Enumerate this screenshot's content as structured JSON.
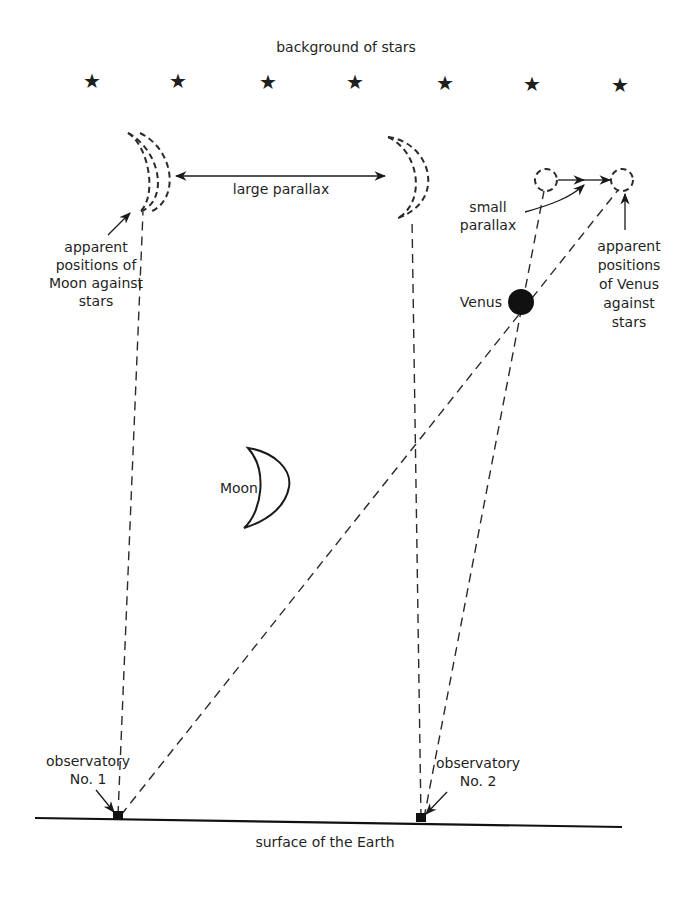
{
  "diagram": {
    "title": "background of stars",
    "star_glyph": "★",
    "stars": [
      {
        "x": 92,
        "y": 82
      },
      {
        "x": 178,
        "y": 82
      },
      {
        "x": 268,
        "y": 83
      },
      {
        "x": 355,
        "y": 83
      },
      {
        "x": 445,
        "y": 84
      },
      {
        "x": 532,
        "y": 85
      },
      {
        "x": 620,
        "y": 86
      }
    ],
    "labels": {
      "large_parallax": "large parallax",
      "small_parallax_line1": "small",
      "small_parallax_line2": "parallax",
      "moon_apparent_line1": "apparent",
      "moon_apparent_line2": "positions of",
      "moon_apparent_line3": "Moon against",
      "moon_apparent_line4": "stars",
      "venus_apparent_line1": "apparent",
      "venus_apparent_line2": "positions",
      "venus_apparent_line3": "of Venus",
      "venus_apparent_line4": "against",
      "venus_apparent_line5": "stars",
      "venus": "Venus",
      "moon": "Moon",
      "obs1_line1": "observatory",
      "obs1_line2": "No. 1",
      "obs2_line1": "observatory",
      "obs2_line2": "No. 2",
      "surface": "surface of the Earth"
    },
    "colors": {
      "ink": "#1a1a1a",
      "background": "#ffffff"
    }
  }
}
